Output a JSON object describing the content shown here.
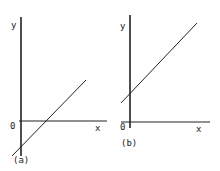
{
  "panels": [
    {
      "id": "a",
      "caption": "(a)",
      "y_label": "y",
      "x_label": "x",
      "origin_label": "0",
      "line": {
        "slope": "positive",
        "y_intercept": "negative"
      }
    },
    {
      "id": "b",
      "caption": "(b)",
      "y_label": "y",
      "x_label": "x",
      "origin_label": "0",
      "line": {
        "slope": "positive",
        "y_intercept": "positive"
      }
    }
  ],
  "colors": {
    "ink": "#222222",
    "background": "#ffffff"
  }
}
